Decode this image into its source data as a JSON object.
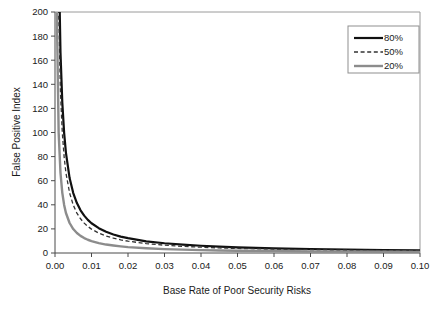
{
  "chart_data": {
    "type": "line",
    "title": "",
    "xlabel": "Base Rate of Poor Security Risks",
    "ylabel": "False Positive Index",
    "xlim": [
      0.0,
      0.1
    ],
    "ylim": [
      0,
      200
    ],
    "grid": false,
    "legend_position": "top-right",
    "xticks": [
      "0.00",
      "0.01",
      "0.02",
      "0.03",
      "0.04",
      "0.05",
      "0.06",
      "0.07",
      "0.08",
      "0.09",
      "0.10"
    ],
    "xtick_values": [
      0.0,
      0.01,
      0.02,
      0.03,
      0.04,
      0.05,
      0.06,
      0.07,
      0.08,
      0.09,
      0.1
    ],
    "yticks": [
      "0",
      "20",
      "40",
      "60",
      "80",
      "100",
      "120",
      "140",
      "160",
      "180",
      "200"
    ],
    "ytick_values": [
      0,
      20,
      40,
      60,
      80,
      100,
      120,
      140,
      160,
      180,
      200
    ],
    "series": [
      {
        "name": "80%",
        "color": "#111111",
        "style": "solid",
        "width": 2.2,
        "x": [
          0.0005,
          0.001,
          0.0015,
          0.002,
          0.0025,
          0.003,
          0.004,
          0.005,
          0.006,
          0.007,
          0.008,
          0.009,
          0.01,
          0.012,
          0.014,
          0.016,
          0.018,
          0.02,
          0.025,
          0.03,
          0.035,
          0.04,
          0.045,
          0.05,
          0.06,
          0.07,
          0.08,
          0.09,
          0.1
        ],
        "values": [
          499.4,
          249.7,
          166.4,
          124.8,
          99.7,
          83.1,
          62.2,
          49.7,
          41.4,
          35.4,
          31.0,
          27.5,
          24.7,
          20.6,
          17.6,
          15.4,
          13.6,
          12.3,
          9.7,
          8.1,
          6.9,
          6.0,
          5.3,
          4.7,
          3.9,
          3.3,
          2.9,
          2.5,
          2.2
        ],
        "formula_note": "FPI = (1-p)/(p*4) approximately, steep hyperbolic decay"
      },
      {
        "name": "50%",
        "color": "#333333",
        "style": "dashed",
        "width": 1.3,
        "x": [
          0.0005,
          0.001,
          0.0015,
          0.002,
          0.0025,
          0.003,
          0.004,
          0.005,
          0.006,
          0.007,
          0.008,
          0.009,
          0.01,
          0.012,
          0.014,
          0.016,
          0.018,
          0.02,
          0.025,
          0.03,
          0.035,
          0.04,
          0.045,
          0.05,
          0.06,
          0.07,
          0.08,
          0.09,
          0.1
        ],
        "values": [
          399.6,
          199.8,
          133.1,
          99.8,
          79.8,
          66.4,
          49.8,
          39.8,
          33.1,
          28.4,
          24.8,
          22.0,
          19.8,
          16.5,
          14.1,
          12.3,
          10.9,
          9.8,
          7.8,
          6.5,
          5.5,
          4.8,
          4.2,
          3.8,
          3.1,
          2.7,
          2.3,
          2.0,
          1.8
        ],
        "formula_note": "intermediate decay, dashed line"
      },
      {
        "name": "20%",
        "color": "#8c8c8c",
        "style": "solid",
        "width": 2.4,
        "x": [
          0.0005,
          0.001,
          0.0015,
          0.002,
          0.0025,
          0.003,
          0.004,
          0.005,
          0.006,
          0.007,
          0.008,
          0.009,
          0.01,
          0.012,
          0.014,
          0.016,
          0.018,
          0.02,
          0.025,
          0.03,
          0.035,
          0.04,
          0.045,
          0.05,
          0.06,
          0.07,
          0.08,
          0.09,
          0.1
        ],
        "values": [
          199.8,
          99.9,
          66.6,
          49.9,
          39.9,
          33.2,
          24.9,
          19.9,
          16.6,
          14.2,
          12.4,
          11.0,
          9.9,
          8.2,
          7.0,
          6.2,
          5.5,
          4.9,
          3.9,
          3.2,
          2.8,
          2.4,
          2.1,
          1.9,
          1.6,
          1.3,
          1.1,
          1.0,
          0.9
        ],
        "formula_note": "shallowest decay, gray solid line"
      }
    ]
  },
  "legend": {
    "entries": [
      {
        "label": "80%"
      },
      {
        "label": "50%"
      },
      {
        "label": "20%"
      }
    ]
  },
  "colors": {
    "series_80": "#111111",
    "series_50": "#333333",
    "series_20": "#8c8c8c",
    "axis": "#4a4a4a",
    "frame": "#9a9a9a",
    "background": "#ffffff"
  }
}
